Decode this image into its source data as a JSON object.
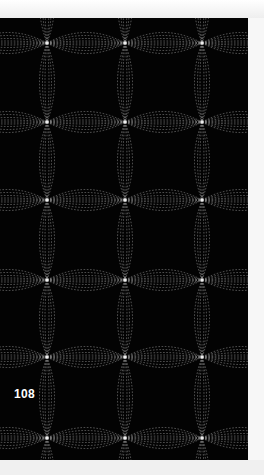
{
  "page": {
    "number": "108",
    "illustration": {
      "description": "quilting stitch pattern of overlapping dashed petal arcs meeting at star nodes",
      "background_color": "#030303",
      "stitch_color": "#bdbdbd",
      "node_color": "#e6e6e6",
      "columns_x": [
        47,
        125,
        202
      ],
      "rows_y": [
        25,
        104,
        182,
        262,
        339,
        420
      ]
    }
  }
}
